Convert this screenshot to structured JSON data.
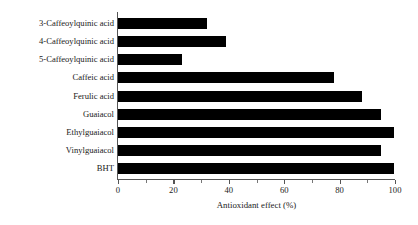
{
  "chart_data": {
    "type": "bar",
    "orientation": "horizontal",
    "title": "",
    "xlabel": "Antioxidant effect (%)",
    "ylabel": "",
    "xlim": [
      0,
      100
    ],
    "xticks": [
      0,
      20,
      40,
      60,
      80,
      100
    ],
    "xtick_labels": [
      "0",
      "20",
      "40",
      "60",
      "80",
      "100"
    ],
    "minor_tick_step": 10,
    "grid": false,
    "legend": null,
    "bar_color": "#000000",
    "axis_color": "#555555",
    "background": "#ffffff",
    "categories": [
      "3-Caffeoylquinic acid",
      "4-Caffeoylquinic acid",
      "5-Caffeoylquinic acid",
      "Caffeic acid",
      "Ferulic acid",
      "Guaiacol",
      "Ethylguaiacol",
      "Vinylguaiacol",
      "BHT"
    ],
    "values": [
      32,
      39,
      23,
      78,
      88,
      95,
      99.5,
      95,
      99.5
    ]
  }
}
